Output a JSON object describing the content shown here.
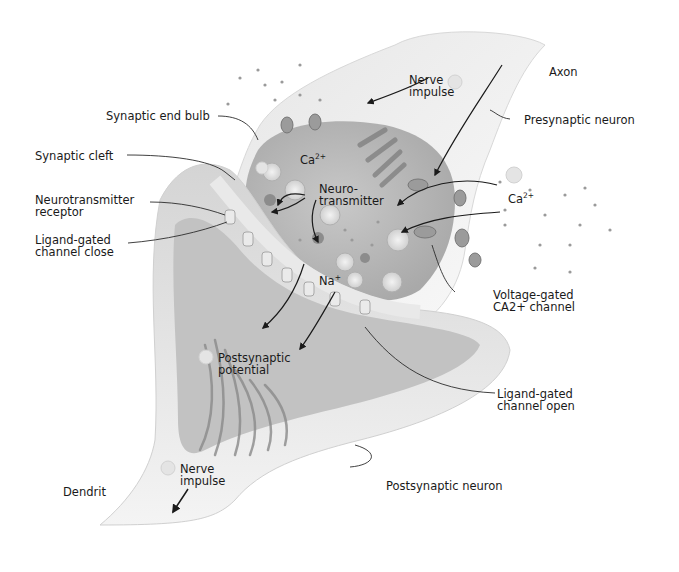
{
  "diagram": {
    "colors": {
      "background": "#ffffff",
      "membrane_light": "#efefef",
      "membrane_mid": "#cfcfcf",
      "interior": "#b9b9b9",
      "dark_detail": "#6f6f6f",
      "leader_line": "#2b2b2b",
      "ion_dot": "#9a9a9a"
    },
    "labels": {
      "axon": "Axon",
      "presynaptic_neuron": "Presynaptic neuron",
      "nerve_impulse_top_1": "Nerve",
      "nerve_impulse_top_2": "impulse",
      "synaptic_end_bulb": "Synaptic end bulb",
      "synaptic_cleft": "Synaptic cleft",
      "neurotransmitter_receptor_1": "Neurotransmitter",
      "neurotransmitter_receptor_2": "receptor",
      "ligand_gated_close_1": "Ligand-gated",
      "ligand_gated_close_2": "channel close",
      "ca_inside": "Ca",
      "ca_inside_sup": "2+",
      "neurotransmitter_1": "Neuro-",
      "neurotransmitter_2": "transmitter",
      "ca_outside": "Ca",
      "ca_outside_sup": "2+",
      "na": "Na",
      "na_sup": "+",
      "voltage_gated_1": "Voltage-gated",
      "voltage_gated_2": "CA2+ channel",
      "postsynaptic_potential_1": "Postsynaptic",
      "postsynaptic_potential_2": "potential",
      "ligand_gated_open_1": "Ligand-gated",
      "ligand_gated_open_2": "channel open",
      "nerve_impulse_bottom_1": "Nerve",
      "nerve_impulse_bottom_2": "impulse",
      "dendrit": "Dendrit",
      "postsynaptic_neuron": "Postsynaptic neuron"
    }
  }
}
